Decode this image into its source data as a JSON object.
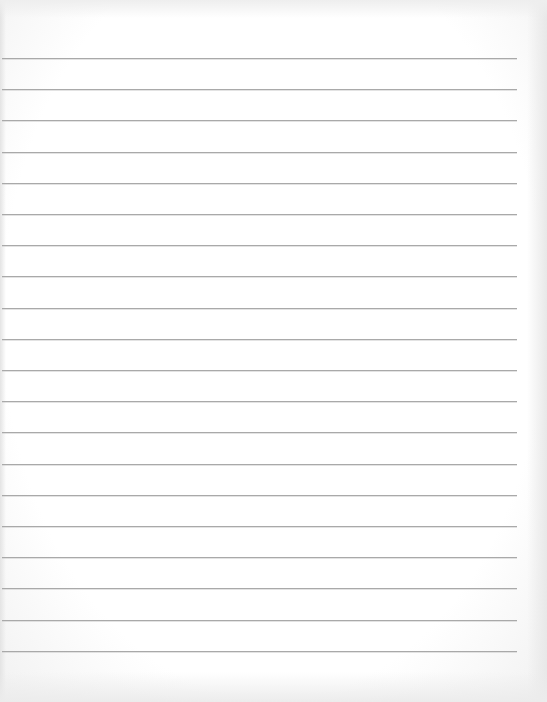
{
  "document": {
    "type": "lined-paper",
    "ruled_line_count": 20,
    "text_content": "",
    "colors": {
      "paper": "#ffffff",
      "rule": "#a9a9a9"
    }
  }
}
